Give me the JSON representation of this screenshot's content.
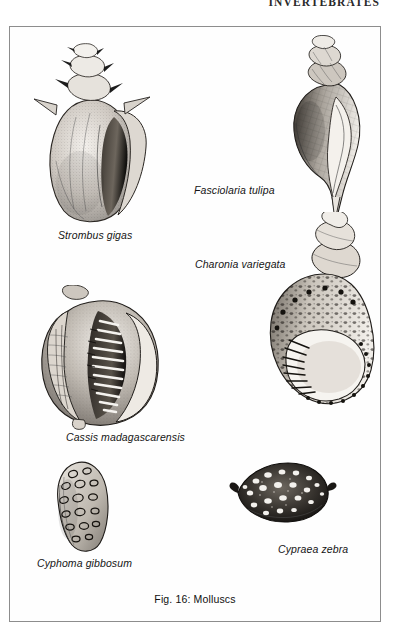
{
  "page": {
    "running_head": "INVERTEBRATES",
    "background_color": "#ffffff",
    "frame_color": "#8d8d8d",
    "ink_color": "#1c1c1c"
  },
  "figure": {
    "caption": "Fig. 16: Molluscs",
    "number": "Fig. 16",
    "subject": "Molluscs"
  },
  "specimens": [
    {
      "id": "strombus-gigas",
      "label": "Strombus gigas",
      "common_group": "conch",
      "position": "top-left"
    },
    {
      "id": "fasciolaria-tulipa",
      "label": "Fasciolaria tulipa",
      "common_group": "tulip snail",
      "position": "top-right"
    },
    {
      "id": "charonia-variegata",
      "label": "Charonia variegata",
      "common_group": "triton",
      "position": "middle-right"
    },
    {
      "id": "cassis-madagascarensis",
      "label": "Cassis madagascarensis",
      "common_group": "helmet shell",
      "position": "middle-left"
    },
    {
      "id": "cyphoma-gibbosum",
      "label": "Cyphoma gibbosum",
      "common_group": "flamingo tongue",
      "position": "bottom-left"
    },
    {
      "id": "cypraea-zebra",
      "label": "Cypraea zebra",
      "common_group": "cowrie",
      "position": "bottom-right"
    }
  ]
}
